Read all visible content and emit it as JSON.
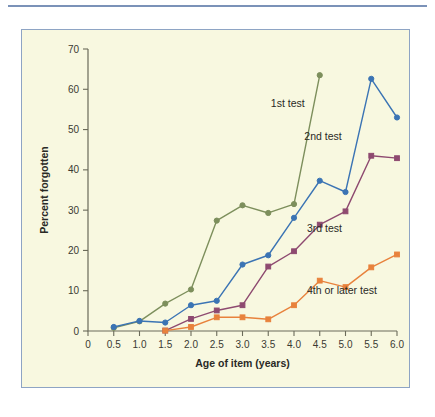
{
  "figure": {
    "background_color": "#ffffff",
    "panel_background_color": "#f8f8e0",
    "panel_border_color": "#8ea4c4",
    "rule_color": "#7b92b8"
  },
  "chart_data": {
    "type": "line",
    "title": "",
    "subtitle": "",
    "xlabel": "Age of item (years)",
    "ylabel": "Percent forgotten",
    "xlim": [
      0,
      6.0
    ],
    "ylim": [
      0,
      70
    ],
    "grid": false,
    "legend_position": "inline-annotations",
    "xticks": [
      "0",
      "0.5",
      "1.0",
      "1.5",
      "2.0",
      "2.5",
      "3.0",
      "3.5",
      "4.0",
      "4.5",
      "5.0",
      "5.5",
      "6.0"
    ],
    "xtick_values": [
      0,
      0.5,
      1.0,
      1.5,
      2.0,
      2.5,
      3.0,
      3.5,
      4.0,
      4.5,
      5.0,
      5.5,
      6.0
    ],
    "yticks": [
      "0",
      "10",
      "20",
      "30",
      "40",
      "50",
      "60",
      "70"
    ],
    "ytick_values": [
      0,
      10,
      20,
      30,
      40,
      50,
      60,
      70
    ],
    "series": [
      {
        "name": "1st test",
        "color": "#7d8f5c",
        "marker": "circle",
        "label_x": 3.55,
        "label_y": 55.5,
        "x": [
          0.5,
          1.0,
          1.5,
          2.0,
          2.5,
          3.0,
          3.5,
          4.0,
          4.5
        ],
        "values": [
          0.8,
          2.4,
          6.8,
          10.3,
          27.4,
          31.2,
          29.3,
          31.5,
          63.5
        ]
      },
      {
        "name": "2nd test",
        "color": "#3b74b4",
        "marker": "circle",
        "label_x": 4.2,
        "label_y": 47.5,
        "x": [
          0.5,
          1.0,
          1.5,
          2.0,
          2.5,
          3.0,
          3.5,
          4.0,
          4.5,
          5.0,
          5.5,
          6.0
        ],
        "values": [
          1.0,
          2.5,
          2.1,
          6.4,
          7.5,
          16.5,
          18.8,
          28.1,
          37.3,
          34.5,
          62.6,
          53.0
        ]
      },
      {
        "name": "3rd test",
        "color": "#8e4a70",
        "marker": "square",
        "label_x": 4.25,
        "label_y": 24.5,
        "x": [
          1.5,
          2.0,
          2.5,
          3.0,
          3.5,
          4.0,
          4.5,
          5.0,
          5.5,
          6.0
        ],
        "values": [
          0.1,
          3.0,
          5.1,
          6.4,
          16.0,
          19.8,
          26.4,
          29.7,
          43.5,
          42.9
        ]
      },
      {
        "name": "4th or later test",
        "color": "#e8823c",
        "marker": "square",
        "label_x": 4.25,
        "label_y": 9.2,
        "x": [
          1.5,
          2.0,
          2.5,
          3.0,
          3.5,
          4.0,
          4.5,
          5.0,
          5.5,
          6.0
        ],
        "values": [
          0.1,
          1.0,
          3.4,
          3.4,
          2.9,
          6.4,
          12.5,
          10.9,
          15.8,
          19.0
        ]
      }
    ]
  }
}
